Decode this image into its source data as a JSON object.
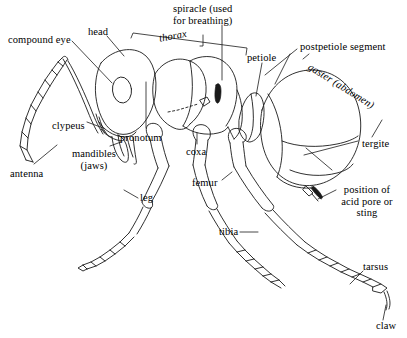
{
  "figure": {
    "background_color": "#ffffff",
    "ink_color": "#1a1a1a"
  },
  "labels": [
    {
      "id": "compound-eye",
      "text": "compound eye",
      "x": 8,
      "y": 34,
      "italic": false,
      "align": "left"
    },
    {
      "id": "head",
      "text": "head",
      "x": 88,
      "y": 26,
      "italic": false,
      "align": "left"
    },
    {
      "id": "thorax",
      "text": "thorax",
      "x": 158,
      "y": 31,
      "italic": true,
      "align": "left"
    },
    {
      "id": "spiracle",
      "text": "spiracle (used\nfor breathing)",
      "x": 173,
      "y": 3,
      "italic": false,
      "align": "left"
    },
    {
      "id": "petiole",
      "text": "petiole",
      "x": 247,
      "y": 52,
      "italic": false,
      "align": "left"
    },
    {
      "id": "postpetiole",
      "text": "postpetiole segment",
      "x": 300,
      "y": 41,
      "italic": false,
      "align": "left"
    },
    {
      "id": "gaster",
      "text": "gaster (abdomen)",
      "x": 312,
      "y": 61,
      "italic": true,
      "align": "left"
    },
    {
      "id": "tergite",
      "text": "tergite",
      "x": 362,
      "y": 138,
      "italic": false,
      "align": "left"
    },
    {
      "id": "clypeus",
      "text": "clypeus",
      "x": 52,
      "y": 120,
      "italic": false,
      "align": "left"
    },
    {
      "id": "pronotum",
      "text": "pronotum",
      "x": 120,
      "y": 132,
      "italic": false,
      "align": "left"
    },
    {
      "id": "mandibles",
      "text": "mandibles\n(jaws)",
      "x": 68,
      "y": 148,
      "italic": false,
      "align": "center"
    },
    {
      "id": "antenna",
      "text": "antenna",
      "x": 10,
      "y": 168,
      "italic": false,
      "align": "left"
    },
    {
      "id": "coxa",
      "text": "coxa",
      "x": 186,
      "y": 146,
      "italic": false,
      "align": "left"
    },
    {
      "id": "femur",
      "text": "femur",
      "x": 192,
      "y": 177,
      "italic": false,
      "align": "left"
    },
    {
      "id": "leg",
      "text": "leg",
      "x": 140,
      "y": 196,
      "italic": false,
      "align": "left"
    },
    {
      "id": "tibia",
      "text": "tibia",
      "x": 219,
      "y": 228,
      "italic": false,
      "align": "left"
    },
    {
      "id": "acid-pore",
      "text": "position of\nacid pore or\nsting",
      "x": 338,
      "y": 185,
      "italic": false,
      "align": "center"
    },
    {
      "id": "tarsus",
      "text": "tarsus",
      "x": 365,
      "y": 262,
      "italic": false,
      "align": "left"
    },
    {
      "id": "claw",
      "text": "claw",
      "x": 377,
      "y": 322,
      "italic": false,
      "align": "left"
    }
  ],
  "anatomy_parts": [
    "compound eye",
    "head",
    "thorax",
    "spiracle (used for breathing)",
    "petiole",
    "postpetiole segment",
    "gaster (abdomen)",
    "tergite",
    "clypeus",
    "pronotum",
    "mandibles (jaws)",
    "antenna",
    "coxa",
    "femur",
    "leg",
    "tibia",
    "position of acid pore or sting",
    "tarsus",
    "claw"
  ]
}
